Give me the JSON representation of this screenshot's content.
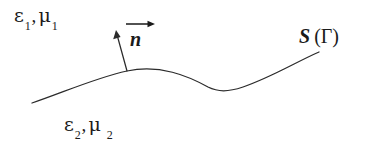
{
  "figure": {
    "background_color": "#ffffff",
    "stroke_color": "#2b2b2b",
    "width": 381,
    "height": 145
  },
  "labels": {
    "medium_upper": {
      "epsilon_symbol": "ε",
      "epsilon_subscript": "1",
      "separator": ",",
      "mu_symbol": "μ",
      "mu_subscript": "1",
      "full_text": "ε₁ , μ₁"
    },
    "medium_lower": {
      "epsilon_symbol": "ε",
      "epsilon_subscript": "2",
      "separator": ",",
      "mu_symbol": "μ",
      "mu_subscript": "2",
      "full_text": "ε₂ , μ₂"
    },
    "normal_vector": {
      "glyph": "n",
      "full_text": "n⃗"
    },
    "surface": {
      "s_glyph": "S",
      "paren_group": "(Γ)",
      "full_text": "S (Γ)"
    }
  },
  "geometry": {
    "interface_curve": {
      "name": "interface-curve",
      "start": [
        32,
        103
      ],
      "crest": [
        127,
        71
      ],
      "trough": [
        216,
        90
      ],
      "end": [
        319,
        52
      ],
      "path": "M 32 103 C 62 93, 95 78, 127 71 C 160 64, 188 76, 208 87 C 218 92, 228 92, 243 87 C 272 77, 296 62, 319 52"
    },
    "normal_arrow": {
      "name": "normal-arrow",
      "tail": [
        127,
        71
      ],
      "tip": [
        116,
        31
      ],
      "arrowhead_width": 5,
      "arrowhead_length": 10
    },
    "vector_overbar_arrow": {
      "name": "vector-overbar-arrow",
      "from_x": 0,
      "to_x": 29,
      "y": 4
    }
  }
}
